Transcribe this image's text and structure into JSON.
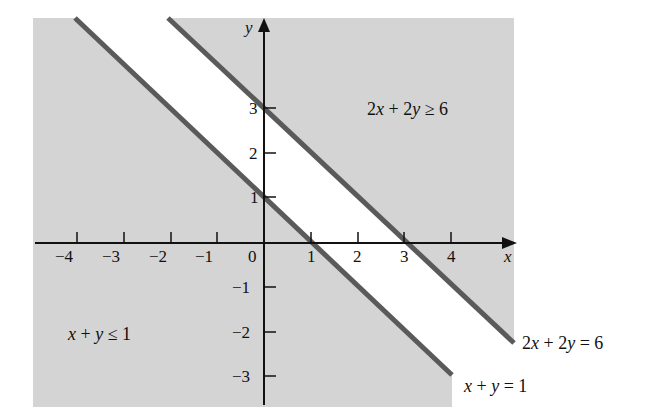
{
  "chart_data": {
    "type": "region",
    "title": "",
    "xlabel": "x",
    "ylabel": "y",
    "xlim": [
      -4.9,
      5.4
    ],
    "ylim": [
      -3.5,
      4.8
    ],
    "x_ticks": [
      -4,
      -3,
      -2,
      -1,
      0,
      1,
      2,
      3,
      4
    ],
    "y_ticks": [
      -3,
      -2,
      -1,
      1,
      2,
      3
    ],
    "x_tick_labels": [
      "−4",
      "−3",
      "−2",
      "−1",
      "0",
      "1",
      "2",
      "3",
      "4"
    ],
    "y_tick_labels": [
      "−3",
      "−2",
      "−1",
      "1",
      "2",
      "3"
    ],
    "grid": false,
    "lines": [
      {
        "name": "x + y = 1",
        "equation": "x + y = 1",
        "points": [
          [
            -3.3,
            4.8
          ],
          [
            4.0,
            -2.8
          ]
        ]
      },
      {
        "name": "2x + 2y = 6",
        "equation": "2x + 2y = 6",
        "points": [
          [
            -2.05,
            4.8
          ],
          [
            5.3,
            -2.1
          ]
        ]
      }
    ],
    "regions": [
      {
        "name": "x + y ≤ 1",
        "shaded": true,
        "color": "#d4d4d4"
      },
      {
        "name": "2x + 2y ≥ 6",
        "shaded": true,
        "color": "#d4d4d4"
      }
    ],
    "annotations": [
      {
        "text": "2x + 2y ≥ 6",
        "x": 2.2,
        "y": 3.5
      },
      {
        "text": "x + y ≤ 1",
        "x": -4.2,
        "y": -2.0
      },
      {
        "text": "2x + 2y = 6",
        "x": 5.5,
        "y": -2.3
      },
      {
        "text": "x + y = 1",
        "x": 4.2,
        "y": -3.0
      }
    ]
  },
  "labels": {
    "y_axis": "y",
    "x_axis": "x",
    "region_upper": "2x + 2y ≥ 6",
    "region_lower": "x + y ≤ 1",
    "line_upper": "2x + 2y = 6",
    "line_lower": "x + y = 1",
    "xt_m4": "−4",
    "xt_m3": "−3",
    "xt_m2": "−2",
    "xt_m1": "−1",
    "xt_0": "0",
    "xt_1": "1",
    "xt_2": "2",
    "xt_3": "3",
    "xt_4": "4",
    "yt_3": "3",
    "yt_2": "2",
    "yt_1": "1",
    "yt_m1": "−1",
    "yt_m2": "−2",
    "yt_m3": "−3"
  },
  "colors": {
    "shade": "#d4d4d4",
    "boundary": "#5a5a5a",
    "axis": "#111111"
  }
}
